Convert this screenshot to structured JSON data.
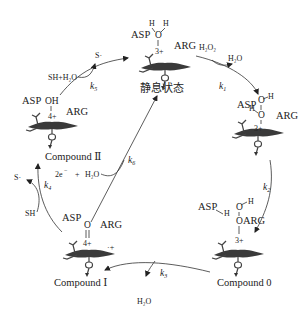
{
  "diagram": {
    "states": {
      "resting": {
        "label": "静息状态",
        "residues": {
          "left": "ASP",
          "right": "ARG"
        },
        "ligand": {
          "atom": "O",
          "h1": "H",
          "h2": "H"
        },
        "charge": "3+"
      },
      "intermediate1": {
        "residues": {
          "left": "ASP",
          "right": "ARG"
        },
        "ligand": {
          "o1": "O",
          "o2": "O",
          "h1": "H",
          "h2": "H"
        },
        "charge": "3+"
      },
      "compound0": {
        "label": "Compound 0",
        "residues": {
          "left": "ASP",
          "right": "ARG"
        },
        "ligand": {
          "o1": "O",
          "o2": "O",
          "h1": "H",
          "h2": "H"
        },
        "charge": "3+"
      },
      "compound1": {
        "label": "Compound Ⅰ",
        "residues": {
          "left": "ASP",
          "right": "ARG"
        },
        "ligand": {
          "atom": "O"
        },
        "charge": "4+",
        "radical": "·+"
      },
      "compound2": {
        "label": "Compound Ⅱ",
        "residues": {
          "left": "ASP",
          "right": "ARG"
        },
        "ligand": {
          "atom": "OH"
        },
        "charge": "4+"
      }
    },
    "steps": {
      "k1": {
        "rate": "k",
        "sub": "1",
        "in": "H₂O₂",
        "out": "H₂O"
      },
      "k2": {
        "rate": "k",
        "sub": "2"
      },
      "k3": {
        "rate": "k",
        "sub": "3",
        "out": "H₂O"
      },
      "k4": {
        "rate": "k",
        "sub": "4",
        "in": "SH",
        "out": "S·"
      },
      "k5": {
        "rate": "k",
        "sub": "5",
        "in": "SH+H₂O",
        "out": "S·"
      },
      "k6": {
        "rate": "k",
        "sub": "6",
        "in_e": "2e",
        "in_e_sup": "−",
        "in_plus": "+",
        "in_water": "H₂O"
      }
    }
  }
}
